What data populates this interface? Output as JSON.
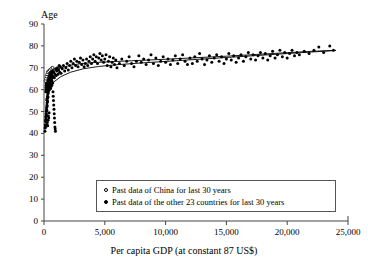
{
  "chart_data": {
    "type": "scatter",
    "title": "",
    "subtitle": "",
    "xlabel": "Per capita GDP (at constant 87 US$)",
    "ylabel": "Age",
    "xlim": [
      0,
      25000
    ],
    "ylim": [
      0,
      90
    ],
    "grid": false,
    "legend_position": "inside-bottom-center",
    "x_ticks": [
      0,
      5000,
      10000,
      15000,
      20000,
      25000
    ],
    "x_tick_labels": [
      "0",
      "5,000",
      "10,000",
      "15,000",
      "20,000",
      "25,000"
    ],
    "y_ticks": [
      0,
      10,
      20,
      30,
      40,
      50,
      60,
      70,
      80,
      90
    ],
    "y_tick_labels": [
      "0",
      "10",
      "20",
      "30",
      "40",
      "50",
      "60",
      "70",
      "80",
      "90"
    ],
    "legend": [
      {
        "marker": "open-circle",
        "label": "Past data of China for last 30 years"
      },
      {
        "marker": "filled-circle",
        "label": "Past data of the other 23 countries for last 30 years"
      }
    ],
    "series": [
      {
        "name": "Past data of the other 23 countries for last 30 years",
        "marker": "filled-circle",
        "color": "#000000",
        "points": [
          [
            80,
            41
          ],
          [
            90,
            42.5
          ],
          [
            110,
            44
          ],
          [
            120,
            43
          ],
          [
            130,
            45.5
          ],
          [
            140,
            46
          ],
          [
            150,
            47.5
          ],
          [
            160,
            46.5
          ],
          [
            170,
            48
          ],
          [
            180,
            49
          ],
          [
            190,
            50
          ],
          [
            200,
            48.5
          ],
          [
            210,
            51
          ],
          [
            220,
            52
          ],
          [
            230,
            50.5
          ],
          [
            240,
            53
          ],
          [
            250,
            54
          ],
          [
            260,
            52.5
          ],
          [
            270,
            55
          ],
          [
            280,
            56
          ],
          [
            290,
            54.5
          ],
          [
            300,
            57
          ],
          [
            310,
            58
          ],
          [
            320,
            56.5
          ],
          [
            330,
            59
          ],
          [
            340,
            60
          ],
          [
            350,
            58.5
          ],
          [
            360,
            61
          ],
          [
            370,
            59.5
          ],
          [
            380,
            62
          ],
          [
            390,
            60.5
          ],
          [
            400,
            63
          ],
          [
            410,
            61.5
          ],
          [
            420,
            64
          ],
          [
            430,
            62.5
          ],
          [
            440,
            60
          ],
          [
            450,
            65
          ],
          [
            460,
            63
          ],
          [
            470,
            61
          ],
          [
            480,
            66
          ],
          [
            490,
            64
          ],
          [
            500,
            62
          ],
          [
            510,
            67
          ],
          [
            520,
            65
          ],
          [
            530,
            63
          ],
          [
            540,
            60.5
          ],
          [
            550,
            68
          ],
          [
            560,
            66
          ],
          [
            570,
            64
          ],
          [
            580,
            61.5
          ],
          [
            590,
            69
          ],
          [
            600,
            67
          ],
          [
            620,
            65
          ],
          [
            640,
            62
          ],
          [
            660,
            70
          ],
          [
            680,
            68
          ],
          [
            700,
            66
          ],
          [
            720,
            63
          ],
          [
            740,
            59
          ],
          [
            760,
            57
          ],
          [
            780,
            55
          ],
          [
            800,
            53
          ],
          [
            820,
            51
          ],
          [
            840,
            49
          ],
          [
            860,
            47
          ],
          [
            880,
            45
          ],
          [
            900,
            43
          ],
          [
            920,
            42
          ],
          [
            940,
            41
          ],
          [
            250,
            44
          ],
          [
            270,
            45
          ],
          [
            300,
            43.5
          ],
          [
            330,
            46
          ],
          [
            360,
            48
          ],
          [
            390,
            47
          ],
          [
            420,
            49.5
          ],
          [
            150,
            59
          ],
          [
            160,
            60
          ],
          [
            170,
            61
          ],
          [
            180,
            62
          ],
          [
            190,
            63
          ],
          [
            200,
            64
          ],
          [
            210,
            62
          ],
          [
            220,
            65
          ],
          [
            230,
            63
          ],
          [
            240,
            66
          ],
          [
            260,
            61
          ],
          [
            280,
            63.5
          ],
          [
            300,
            65.5
          ],
          [
            320,
            62
          ],
          [
            340,
            64
          ],
          [
            360,
            66.5
          ],
          [
            380,
            63
          ],
          [
            400,
            65
          ],
          [
            430,
            67
          ],
          [
            460,
            64.5
          ],
          [
            500,
            66
          ],
          [
            540,
            68
          ],
          [
            580,
            65
          ],
          [
            620,
            67.5
          ],
          [
            660,
            64
          ],
          [
            700,
            69
          ],
          [
            750,
            66
          ],
          [
            800,
            68
          ],
          [
            850,
            65.5
          ],
          [
            900,
            67
          ],
          [
            950,
            69.5
          ],
          [
            1000,
            66.5
          ],
          [
            1050,
            68.5
          ],
          [
            1100,
            70
          ],
          [
            1150,
            67
          ],
          [
            1200,
            69
          ],
          [
            1250,
            71
          ],
          [
            1300,
            68
          ],
          [
            1350,
            70.5
          ],
          [
            1400,
            67.5
          ],
          [
            1500,
            69.5
          ],
          [
            1600,
            71
          ],
          [
            1700,
            68.5
          ],
          [
            1800,
            70
          ],
          [
            1900,
            72
          ],
          [
            2000,
            69
          ],
          [
            2100,
            71
          ],
          [
            2200,
            73
          ],
          [
            2300,
            70
          ],
          [
            2400,
            72
          ],
          [
            2500,
            74
          ],
          [
            2600,
            71
          ],
          [
            2700,
            73
          ],
          [
            2800,
            70.5
          ],
          [
            2900,
            72.5
          ],
          [
            3000,
            74.5
          ],
          [
            3100,
            71.5
          ],
          [
            3200,
            73.5
          ],
          [
            3300,
            70.5
          ],
          [
            3400,
            72
          ],
          [
            3500,
            74
          ],
          [
            3600,
            71
          ],
          [
            3700,
            73
          ],
          [
            3800,
            75
          ],
          [
            3900,
            72
          ],
          [
            4000,
            74
          ],
          [
            4100,
            76
          ],
          [
            4200,
            73
          ],
          [
            4300,
            75
          ],
          [
            4400,
            72
          ],
          [
            4500,
            74.5
          ],
          [
            4600,
            76.5
          ],
          [
            4700,
            73.5
          ],
          [
            4800,
            75.5
          ],
          [
            4900,
            72.5
          ],
          [
            5000,
            74
          ],
          [
            5100,
            76
          ],
          [
            5200,
            71
          ],
          [
            5300,
            73
          ],
          [
            5400,
            75
          ],
          [
            5500,
            70.5
          ],
          [
            5600,
            72.5
          ],
          [
            5700,
            74.5
          ],
          [
            5800,
            71.5
          ],
          [
            5900,
            73.5
          ],
          [
            6000,
            70
          ],
          [
            6200,
            72
          ],
          [
            6400,
            74
          ],
          [
            6600,
            71
          ],
          [
            6800,
            73
          ],
          [
            7000,
            75
          ],
          [
            7200,
            72
          ],
          [
            7400,
            70.5
          ],
          [
            7600,
            73
          ],
          [
            7800,
            75.5
          ],
          [
            8000,
            72.5
          ],
          [
            8200,
            74
          ],
          [
            8400,
            71.5
          ],
          [
            8600,
            73.5
          ],
          [
            8800,
            76
          ],
          [
            9000,
            72
          ],
          [
            9200,
            74.5
          ],
          [
            9400,
            71
          ],
          [
            9600,
            73
          ],
          [
            9800,
            75
          ],
          [
            10000,
            72.5
          ],
          [
            10200,
            74
          ],
          [
            10400,
            71.5
          ],
          [
            10600,
            73.5
          ],
          [
            10800,
            75.5
          ],
          [
            11000,
            72
          ],
          [
            11200,
            74
          ],
          [
            11400,
            76
          ],
          [
            11600,
            73
          ],
          [
            11800,
            71.5
          ],
          [
            12000,
            74.5
          ],
          [
            12200,
            72
          ],
          [
            12400,
            75
          ],
          [
            12600,
            73
          ],
          [
            12800,
            76.5
          ],
          [
            13000,
            74
          ],
          [
            13200,
            71.5
          ],
          [
            13400,
            73.5
          ],
          [
            13600,
            75.5
          ],
          [
            13800,
            72.5
          ],
          [
            14000,
            74.5
          ],
          [
            14200,
            76
          ],
          [
            14400,
            73
          ],
          [
            14600,
            75
          ],
          [
            14800,
            72
          ],
          [
            15000,
            74
          ],
          [
            15200,
            76.5
          ],
          [
            15400,
            73.5
          ],
          [
            15600,
            75.5
          ],
          [
            15800,
            72.5
          ],
          [
            16000,
            74.5
          ],
          [
            16200,
            76
          ],
          [
            16400,
            73
          ],
          [
            16600,
            75
          ],
          [
            16800,
            77
          ],
          [
            17000,
            74
          ],
          [
            17200,
            76
          ],
          [
            17400,
            73.5
          ],
          [
            17600,
            75.5
          ],
          [
            17800,
            77
          ],
          [
            18000,
            74.5
          ],
          [
            18200,
            76.5
          ],
          [
            18400,
            73.5
          ],
          [
            18600,
            75.5
          ],
          [
            18800,
            77.5
          ],
          [
            19000,
            74.5
          ],
          [
            19200,
            76
          ],
          [
            19400,
            78
          ],
          [
            19600,
            75
          ],
          [
            19800,
            77
          ],
          [
            20000,
            74.5
          ],
          [
            20200,
            76.5
          ],
          [
            20400,
            78
          ],
          [
            20600,
            75.5
          ],
          [
            20800,
            77
          ],
          [
            21000,
            76
          ],
          [
            21400,
            77.5
          ],
          [
            21800,
            76.5
          ],
          [
            22200,
            78
          ],
          [
            22600,
            79.5
          ],
          [
            23000,
            77
          ],
          [
            23500,
            80
          ],
          [
            23800,
            78
          ]
        ]
      },
      {
        "name": "Past data of China for last 30 years",
        "marker": "open-circle",
        "color": "#000000",
        "points": [
          [
            130,
            64
          ],
          [
            160,
            65
          ],
          [
            200,
            66
          ],
          [
            250,
            67
          ],
          [
            300,
            68
          ],
          [
            380,
            68.5
          ],
          [
            470,
            69
          ],
          [
            580,
            69.5
          ],
          [
            700,
            70
          ]
        ]
      }
    ],
    "fit_curves": [
      {
        "name": "upper-fitted-curve",
        "points": [
          [
            120,
            63.5
          ],
          [
            400,
            66.5
          ],
          [
            800,
            68.5
          ],
          [
            1400,
            70.0
          ],
          [
            2200,
            71.2
          ],
          [
            3200,
            72.0
          ],
          [
            4500,
            72.5
          ],
          [
            6000,
            72.9
          ],
          [
            8000,
            73.4
          ],
          [
            10000,
            73.9
          ],
          [
            12500,
            74.6
          ],
          [
            15000,
            75.3
          ],
          [
            17500,
            76.1
          ],
          [
            20000,
            76.9
          ],
          [
            22000,
            77.5
          ],
          [
            24000,
            78.0
          ]
        ]
      },
      {
        "name": "lower-fitted-curve",
        "points": [
          [
            120,
            55.0
          ],
          [
            400,
            60.0
          ],
          [
            800,
            63.5
          ],
          [
            1400,
            66.0
          ],
          [
            2200,
            68.0
          ],
          [
            3200,
            69.5
          ],
          [
            4500,
            70.6
          ],
          [
            6000,
            71.4
          ],
          [
            8000,
            72.2
          ],
          [
            10000,
            72.9
          ],
          [
            12500,
            73.8
          ],
          [
            15000,
            74.7
          ],
          [
            17500,
            75.6
          ],
          [
            20000,
            76.5
          ],
          [
            22000,
            77.2
          ],
          [
            24000,
            77.9
          ]
        ]
      }
    ]
  },
  "axis": {
    "y_title": "Age",
    "x_title": "Per capita GDP (at constant 87 US$)"
  },
  "legend": {
    "items": [
      {
        "label": "Past data of China for last 30 years"
      },
      {
        "label": "Past data of the other 23 countries for last 30 years"
      }
    ]
  }
}
